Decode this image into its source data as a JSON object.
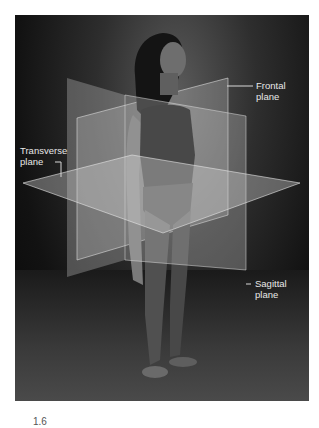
{
  "figure": {
    "type": "anatomical-planes-photo",
    "labels": {
      "frontal": "Frontal\nplane",
      "transverse": "Transverse\nplane",
      "sagittal": "Sagittal\nplane"
    },
    "caption_fragment": "1.6"
  },
  "colors": {
    "background": "#ffffff",
    "photo_dark": "#0a0a0a",
    "plane_fill": "#c8c8c8",
    "label_text": "#e8e8e8",
    "leader_line": "#d8d8d8"
  }
}
